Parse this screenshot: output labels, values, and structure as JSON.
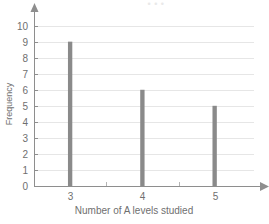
{
  "top_caption": "• • •",
  "chart_data": {
    "type": "bar",
    "title": "",
    "xlabel": "Number of A levels studied",
    "ylabel": "Frequency",
    "categories": [
      "3",
      "4",
      "5"
    ],
    "x": [
      3,
      4,
      5
    ],
    "values": [
      9,
      6,
      5
    ],
    "xlim": [
      2.5,
      5.6
    ],
    "ylim": [
      0,
      10.6
    ],
    "x_tick_labels": [
      "3",
      "4",
      "5"
    ],
    "y_tick_labels": [
      "0",
      "1",
      "2",
      "3",
      "4",
      "5",
      "6",
      "7",
      "8",
      "9",
      "10"
    ],
    "x_minor_ticks": [
      3.5,
      4.5
    ],
    "grid": "horizontal",
    "legend": "none",
    "bar_color": "#8a8a8a",
    "grid_color": "#e6e6e6",
    "axis_color": "#8e8e8e",
    "background_color": "#ffffff",
    "bar_width_units": 0.06,
    "axis_arrows": true
  }
}
